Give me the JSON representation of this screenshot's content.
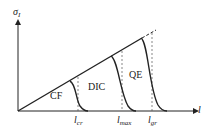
{
  "diagram": {
    "y_axis_label": "σ",
    "y_axis_label_sub": "I",
    "y_axis_label_sup": "I",
    "x_axis_label": "l",
    "regions": [
      {
        "label": "CF"
      },
      {
        "label": "DIC"
      },
      {
        "label": "QE"
      }
    ],
    "x_ticks": [
      {
        "main": "l",
        "sub": "cr"
      },
      {
        "main": "l",
        "sub": "max"
      },
      {
        "main": "l",
        "sub": "gr"
      }
    ],
    "colors": {
      "line": "#222222",
      "dashed": "#555555"
    }
  }
}
